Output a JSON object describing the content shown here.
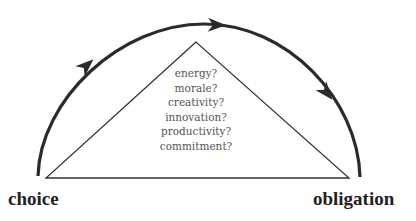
{
  "diagram": {
    "left_label": "choice",
    "right_label": "obligation",
    "triangle_items": [
      "energy?",
      "morale?",
      "creativity?",
      "innovation?",
      "productivity?",
      "commitment?"
    ],
    "arc_arrows": 3,
    "colors": {
      "arc": "#2b2b2b",
      "triangle": "#333333",
      "text": "#555555",
      "labels": "#222222"
    }
  }
}
